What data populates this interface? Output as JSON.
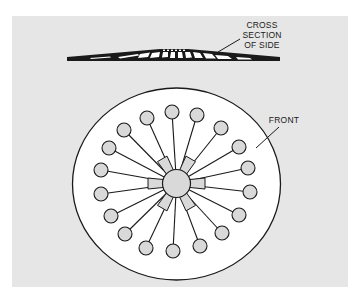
{
  "figure": {
    "panel_color": "#e6e6e6",
    "ink_color": "#1a1a1a",
    "fill_light": "#d9d9d9",
    "disk_fill": "#ffffff"
  },
  "labels": {
    "cross_section": [
      "CROSS",
      "SECTION",
      "OF SIDE"
    ],
    "front": "FRONT"
  },
  "diagram": {
    "disk": {
      "cx": 176.5,
      "cy": 184,
      "rx": 104,
      "ry": 96
    },
    "hub": {
      "cx": 176.5,
      "cy": 183.5,
      "r": 14
    },
    "tab_angles_deg": [
      0,
      60,
      120,
      180,
      240,
      300
    ],
    "nodes": [
      [
        172,
        112
      ],
      [
        147,
        118
      ],
      [
        197,
        115
      ],
      [
        124,
        130
      ],
      [
        221,
        128
      ],
      [
        109,
        148
      ],
      [
        239,
        147
      ],
      [
        101,
        170
      ],
      [
        248,
        168
      ],
      [
        101,
        194
      ],
      [
        250,
        192
      ],
      [
        111,
        216
      ],
      [
        239,
        215
      ],
      [
        125,
        234
      ],
      [
        222,
        233
      ],
      [
        146,
        248
      ],
      [
        200,
        246
      ],
      [
        173,
        251
      ]
    ],
    "node_r": 7
  }
}
